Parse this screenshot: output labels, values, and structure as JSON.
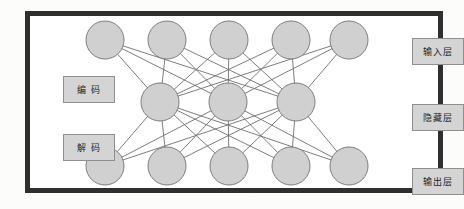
{
  "figure": {
    "type": "neural-network-diagram",
    "frame_color": "#2f2f2f",
    "background_color": "#ffffff",
    "page_background": "#fcfcfb"
  },
  "style": {
    "node_fill": "#d0d0d0",
    "node_stroke": "#7d7d7d",
    "edge_color": "#6e6e6e",
    "label_fill": "#d4d4d4",
    "label_stroke": "#8f8f8f",
    "label_text_color": "#1e1e1e"
  },
  "layers": [
    {
      "id": "input",
      "label": "输入层",
      "node_count": 5,
      "y": 40,
      "node_radius": 19,
      "node_x": [
        105,
        167,
        229,
        291,
        349
      ]
    },
    {
      "id": "hidden",
      "label": "隐藏层",
      "node_count": 3,
      "y": 102,
      "node_radius": 19,
      "node_x": [
        160,
        228,
        296
      ]
    },
    {
      "id": "output",
      "label": "输出层",
      "node_count": 5,
      "y": 166,
      "node_radius": 19,
      "node_x": [
        105,
        167,
        229,
        291,
        349
      ]
    }
  ],
  "connections": [
    {
      "from": "input",
      "to": "hidden",
      "pattern": "fully-connected"
    },
    {
      "from": "hidden",
      "to": "output",
      "pattern": "fully-connected"
    }
  ],
  "side_labels": {
    "encode": "编 码",
    "decode": "解 码"
  },
  "layer_labels": {
    "input": "输入层",
    "hidden": "隐藏层",
    "output": "输出层"
  }
}
